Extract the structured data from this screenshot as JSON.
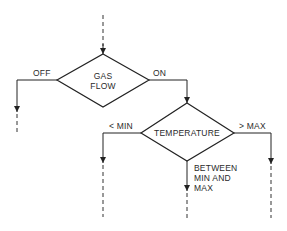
{
  "diagram": {
    "type": "flowchart",
    "nodes": [
      {
        "id": "gas_flow",
        "shape": "diamond",
        "lines": [
          "GAS",
          "FLOW"
        ]
      },
      {
        "id": "temperature",
        "shape": "diamond",
        "lines": [
          "TEMPERATURE"
        ]
      }
    ],
    "edges": [
      {
        "from": "entry",
        "to": "gas_flow",
        "label": ""
      },
      {
        "from": "gas_flow",
        "to": "exit_off",
        "label": "OFF"
      },
      {
        "from": "gas_flow",
        "to": "temperature",
        "label": "ON"
      },
      {
        "from": "temperature",
        "to": "exit_min",
        "label": "< MIN"
      },
      {
        "from": "temperature",
        "to": "exit_max",
        "label": "> MAX"
      },
      {
        "from": "temperature",
        "to": "exit_between",
        "label": "BETWEEN MIN AND MAX"
      }
    ],
    "labels": {
      "gas_line1": "GAS",
      "gas_line2": "FLOW",
      "off": "OFF",
      "on": "ON",
      "temperature": "TEMPERATURE",
      "min": "< MIN",
      "max": "> MAX",
      "between_line1": "BETWEEN",
      "between_line2": "MIN AND",
      "between_line3": "MAX"
    },
    "colors": {
      "line": "#222222",
      "background": "#ffffff"
    }
  }
}
